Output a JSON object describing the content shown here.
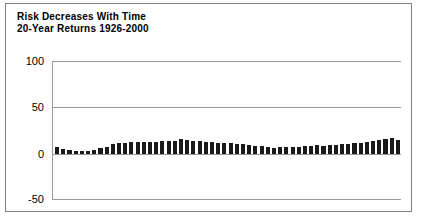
{
  "chart": {
    "title": "Risk Decreases With Time",
    "subtitle": "20-Year Returns 1926-2000"
  },
  "axis": {
    "y_ticks": [
      "100",
      "50",
      "0",
      "-50"
    ]
  },
  "colors": {
    "bar": "#1a1a1a",
    "grid": "#9a9a9a",
    "border": "#808080",
    "text": "#000000",
    "background": "#ffffff"
  },
  "chart_data": {
    "type": "bar",
    "title": "Risk Decreases With Time",
    "subtitle": "20-Year Returns 1926-2000",
    "xlabel": "",
    "ylabel": "",
    "ylim": [
      -50,
      100
    ],
    "yticks": [
      -50,
      0,
      50,
      100
    ],
    "grid": true,
    "legend": null,
    "categories": [
      "1926-1945",
      "1927-1946",
      "1928-1947",
      "1929-1948",
      "1930-1949",
      "1931-1950",
      "1932-1951",
      "1933-1952",
      "1934-1953",
      "1935-1954",
      "1936-1955",
      "1937-1956",
      "1938-1957",
      "1939-1958",
      "1940-1959",
      "1941-1960",
      "1942-1961",
      "1943-1962",
      "1944-1963",
      "1945-1964",
      "1946-1965",
      "1947-1966",
      "1948-1967",
      "1949-1968",
      "1950-1969",
      "1951-1970",
      "1952-1971",
      "1953-1972",
      "1954-1973",
      "1955-1974",
      "1956-1975",
      "1957-1976",
      "1958-1977",
      "1959-1978",
      "1960-1979",
      "1961-1980",
      "1962-1981",
      "1963-1982",
      "1964-1983",
      "1965-1984",
      "1966-1985",
      "1967-1986",
      "1968-1987",
      "1969-1988",
      "1970-1989",
      "1971-1990",
      "1972-1991",
      "1973-1992",
      "1974-1993",
      "1975-1994",
      "1976-1995",
      "1977-1996",
      "1978-1997",
      "1979-1998",
      "1980-1999",
      "1981-2000"
    ],
    "values": [
      7.1,
      5.5,
      4.5,
      3.1,
      3.1,
      3.2,
      4.5,
      6.0,
      8.0,
      10.5,
      12.5,
      11.5,
      12.8,
      13.5,
      13.0,
      13.2,
      13.5,
      13.8,
      14.0,
      14.5,
      16.5,
      15.0,
      14.5,
      14.0,
      13.5,
      13.0,
      12.5,
      12.0,
      11.5,
      11.0,
      10.5,
      9.5,
      9.0,
      8.5,
      7.5,
      7.0,
      7.5,
      8.0,
      7.5,
      8.0,
      8.5,
      9.0,
      9.5,
      9.0,
      9.5,
      10.0,
      10.5,
      11.0,
      11.5,
      12.5,
      13.5,
      14.5,
      15.5,
      16.5,
      17.8,
      15.5
    ]
  }
}
